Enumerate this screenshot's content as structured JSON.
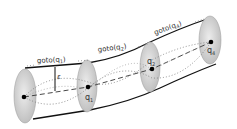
{
  "diagram": {
    "segments": [
      {
        "label": "goto(q",
        "sub": "1",
        "close": ")"
      },
      {
        "label": "goto(q",
        "sub": "2",
        "close": ")"
      },
      {
        "label": "goto(q",
        "sub": "4",
        "close": ")"
      }
    ],
    "points": [
      {
        "name": "start",
        "label": ""
      },
      {
        "name": "q1",
        "label": "q",
        "sub": "1"
      },
      {
        "name": "q2",
        "label": "q",
        "sub": "2"
      },
      {
        "name": "q4",
        "label": "q",
        "sub": "4"
      }
    ],
    "radius_label": "ε",
    "colors": {
      "line": "#111111",
      "disk": "#d6d6d6",
      "dot": "#000000",
      "path": "#888888"
    }
  }
}
